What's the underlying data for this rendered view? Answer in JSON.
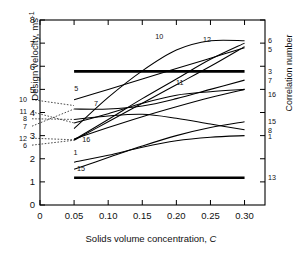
{
  "axes": {
    "y_title": "Design velocity, ms",
    "y_title_sup": "-1",
    "x_title_main": "Solids volume concentration, ",
    "x_title_italic": "C",
    "right_title": "Correlation number",
    "y_ticks": [
      "0",
      "1",
      "2",
      "3",
      "4",
      "5",
      "6",
      "7",
      "8"
    ],
    "x_ticks": [
      "0",
      "0.05",
      "0.10",
      "0.15",
      "0.20",
      "0.25",
      "0.30"
    ]
  },
  "chart_data": {
    "type": "line",
    "title": "",
    "xlabel": "Solids volume concentration, C",
    "ylabel": "Design velocity, ms-1",
    "right_axis_label": "Correlation number",
    "xlim": [
      0,
      0.33
    ],
    "ylim": [
      0,
      8
    ],
    "x_ticks": [
      0,
      0.05,
      0.1,
      0.15,
      0.2,
      0.25,
      0.3
    ],
    "y_ticks": [
      0,
      1,
      2,
      3,
      4,
      5,
      6,
      7,
      8
    ],
    "grid": false,
    "legend": "inline-endpoint-labels",
    "x": [
      0.05,
      0.1,
      0.15,
      0.2,
      0.25,
      0.3
    ],
    "series": [
      {
        "name": "1",
        "values": [
          1.85,
          2.15,
          2.5,
          2.78,
          2.93,
          3.0
        ],
        "label_left": "1",
        "label_right": "1",
        "thick": false
      },
      {
        "name": "3",
        "values": [
          5.78,
          5.78,
          5.78,
          5.78,
          5.78,
          5.78
        ],
        "label_left": "3",
        "label_right": "3",
        "thick": true
      },
      {
        "name": "5",
        "values": [
          4.55,
          5.0,
          5.45,
          5.9,
          6.35,
          6.8
        ],
        "label_left": "5",
        "label_right": "5",
        "thick": false
      },
      {
        "name": "6",
        "values": [
          2.8,
          3.6,
          4.4,
          5.2,
          6.0,
          6.85
        ],
        "label_left": "6",
        "label_right": "6",
        "thick": false
      },
      {
        "name": "7",
        "values": [
          4.15,
          4.15,
          4.28,
          4.6,
          5.0,
          5.4
        ],
        "label_left": "7",
        "label_right": "7",
        "thick": false
      },
      {
        "name": "8",
        "values": [
          3.7,
          3.85,
          3.92,
          3.75,
          3.5,
          3.25
        ],
        "label_left": "8",
        "label_right": "8",
        "thick": false
      },
      {
        "name": "10",
        "values": [
          3.3,
          4.65,
          5.8,
          6.7,
          7.1,
          7.1
        ],
        "label_left": "10",
        "label_right": "",
        "thick": false
      },
      {
        "name": "11",
        "values": [
          3.55,
          3.95,
          4.4,
          4.75,
          4.9,
          5.0
        ],
        "label_left": "11",
        "label_right": "",
        "thick": false
      },
      {
        "name": "12",
        "values": [
          2.82,
          3.7,
          4.6,
          5.45,
          6.3,
          7.0
        ],
        "label_left": "12",
        "label_right": "",
        "thick": false
      },
      {
        "name": "13",
        "values": [
          1.18,
          1.18,
          1.18,
          1.18,
          1.18,
          1.18
        ],
        "label_left": "13",
        "label_right": "13",
        "thick": true
      },
      {
        "name": "15",
        "values": [
          1.55,
          2.05,
          2.55,
          3.0,
          3.35,
          3.6
        ],
        "label_left": "15",
        "label_right": "15",
        "thick": false
      },
      {
        "name": "16",
        "values": [
          2.85,
          3.35,
          3.82,
          4.25,
          4.65,
          5.0
        ],
        "label_left": "16",
        "label_right": "16",
        "thick": false
      }
    ],
    "inline_labels": [
      {
        "text": "10",
        "x": 0.175,
        "y": 7.2
      },
      {
        "text": "12",
        "x": 0.245,
        "y": 7.05
      },
      {
        "text": "11",
        "x": 0.205,
        "y": 5.2
      },
      {
        "text": "7",
        "x": 0.082,
        "y": 4.3
      },
      {
        "text": "5",
        "x": 0.053,
        "y": 4.95
      },
      {
        "text": "16",
        "x": 0.068,
        "y": 2.72
      },
      {
        "text": "1",
        "x": 0.052,
        "y": 2.15
      },
      {
        "text": "15",
        "x": 0.06,
        "y": 1.45
      }
    ],
    "left_stack_labels": [
      "10",
      "11",
      "8",
      "7",
      "12",
      "6"
    ],
    "right_stack_labels": [
      "6",
      "5",
      "3",
      "7",
      "16",
      "15",
      "8",
      "1",
      "13"
    ]
  }
}
